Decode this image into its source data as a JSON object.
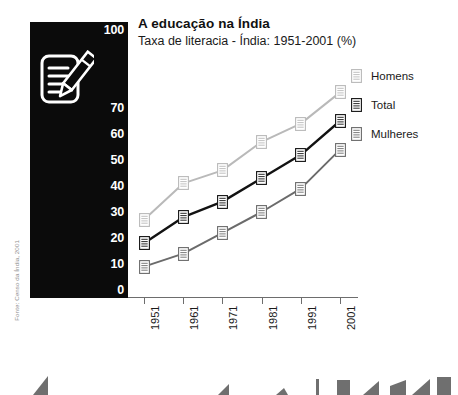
{
  "header": {
    "title": "A educação na Índia",
    "subtitle": "Taxa de literacia - Índia: 1951-2001 (%)"
  },
  "source": {
    "text": "Fonte: Censo da Índia, 2001"
  },
  "panel": {
    "background_color": "#0b0b0b",
    "icon_name": "document-pencil-icon",
    "icon_color": "#ffffff"
  },
  "axis": {
    "y_ticks": [
      "100",
      "70",
      "60",
      "50",
      "40",
      "30",
      "20",
      "10",
      "0"
    ],
    "y_tick_values": [
      100,
      70,
      60,
      50,
      40,
      30,
      20,
      10,
      0
    ],
    "x_ticks": [
      "1951",
      "1961",
      "1971",
      "1981",
      "1991",
      "2001"
    ]
  },
  "legend": {
    "position": "right",
    "items": [
      {
        "label": "Homens",
        "color": "#b9b9b9"
      },
      {
        "label": "Total",
        "color": "#121212"
      },
      {
        "label": "Mulheres",
        "color": "#6b6b6b"
      }
    ]
  },
  "chart_data": {
    "type": "line",
    "title": "A educação na Índia",
    "subtitle": "Taxa de literacia - Índia: 1951-2001 (%)",
    "xlabel": "",
    "ylabel": "",
    "unit": "%",
    "grid": false,
    "legend_position": "right",
    "categories": [
      "1951",
      "1961",
      "1971",
      "1981",
      "1991",
      "2001"
    ],
    "x": [
      1951,
      1961,
      1971,
      1981,
      1991,
      2001
    ],
    "ylim": [
      0,
      100
    ],
    "yticks": [
      0,
      10,
      20,
      30,
      40,
      50,
      60,
      70,
      100
    ],
    "series": [
      {
        "name": "Homens",
        "color": "#b9b9b9",
        "values": [
          27,
          41,
          46,
          57,
          64,
          76
        ]
      },
      {
        "name": "Total",
        "color": "#121212",
        "values": [
          18,
          28,
          34,
          43,
          52,
          65
        ]
      },
      {
        "name": "Mulheres",
        "color": "#6b6b6b",
        "values": [
          9,
          14,
          22,
          30,
          39,
          54
        ]
      }
    ],
    "source": "Fonte: Censo da Índia, 2001"
  }
}
